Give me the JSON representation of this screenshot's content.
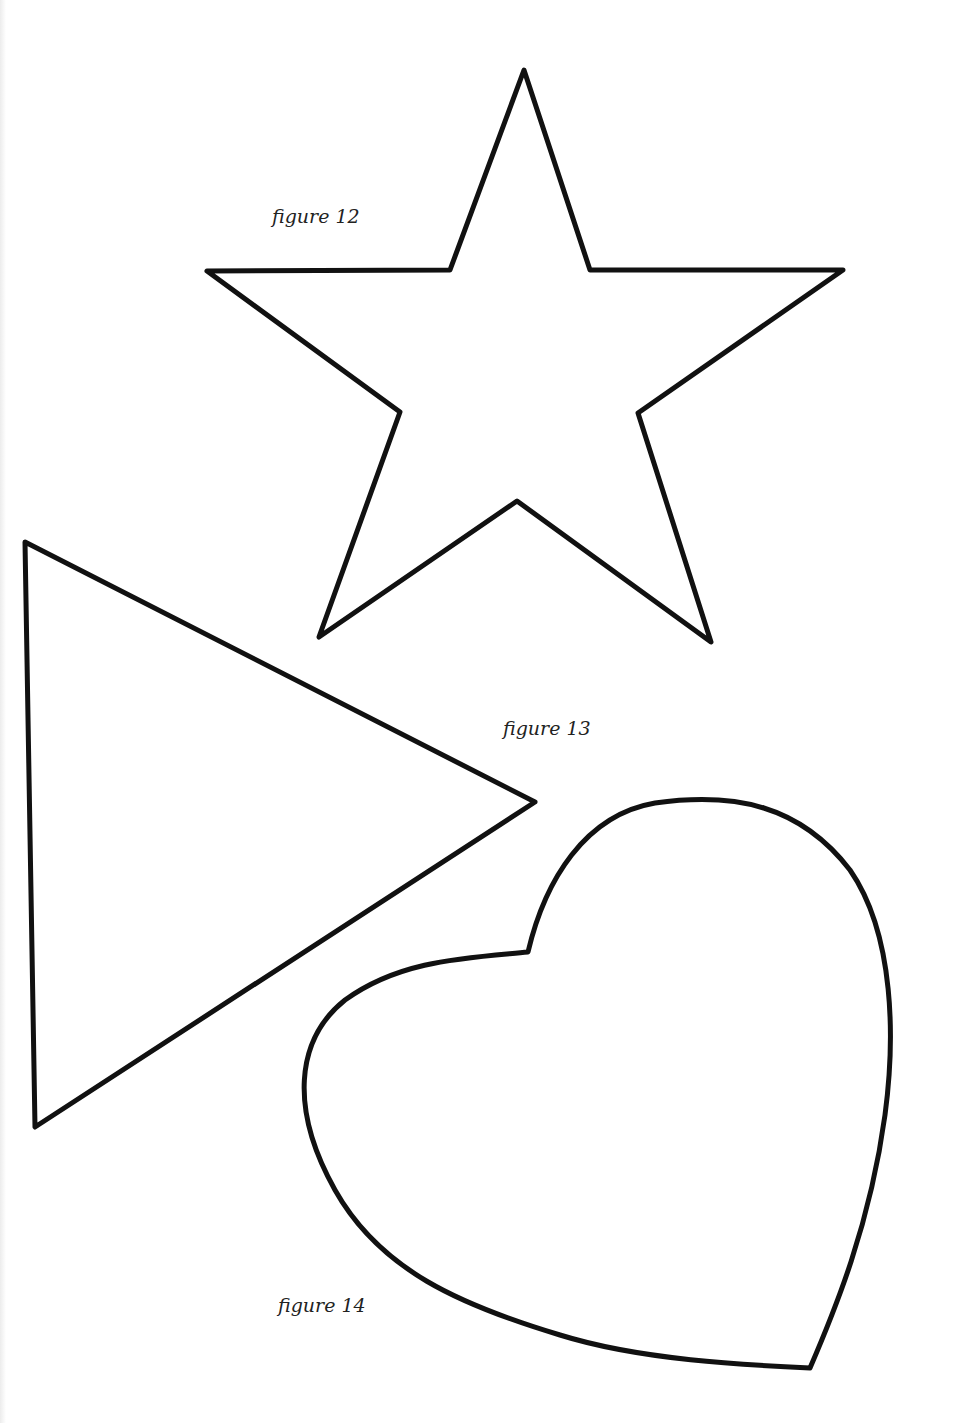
{
  "page": {
    "background": "#ffffff",
    "stroke_color": "#111111"
  },
  "figures": [
    {
      "id": "figure-12",
      "shape": "star",
      "caption": "figure 12",
      "caption_pos": {
        "x": 272,
        "y": 207
      },
      "points": "524,70 590,270 843,270 638,413 711,642 517,501 319,637 400,412 207,271 450,270"
    },
    {
      "id": "figure-13",
      "shape": "triangle",
      "caption": "figure 13",
      "caption_pos": {
        "x": 503,
        "y": 719
      },
      "points": "25,542 535,802 35,1127"
    },
    {
      "id": "figure-14",
      "shape": "heart",
      "caption": "figure 14",
      "caption_pos": {
        "x": 278,
        "y": 1296
      },
      "path": "M528,952 C545,880 585,815 655,803 C735,792 800,805 850,870 C895,935 895,1040 885,1115 C870,1225 835,1310 810,1368 C745,1365 640,1360 560,1335 C460,1305 380,1270 335,1190 C290,1110 295,1040 345,1000 C400,960 465,958 528,952 Z"
    }
  ]
}
